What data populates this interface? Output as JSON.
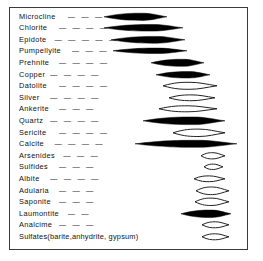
{
  "figure": {
    "type": "paragenetic-sequence-diagram",
    "border_color": "#3a3a3a",
    "background": "#ffffff",
    "fill_color": "#000000",
    "outline_color": "#222222",
    "leader_dash": "—",
    "rows": [
      {
        "label": "Microcline",
        "dashes": "—  —  —  —",
        "lens_start": 103,
        "lens_end": 166,
        "fill": "solid",
        "thickness": 7.2
      },
      {
        "label": "Chlorite",
        "dashes": "—  —  —  —  —",
        "lens_start": 103,
        "lens_end": 182,
        "fill": "solid",
        "thickness": 6.6
      },
      {
        "label": "Epidote",
        "dashes": "—  —  —  —  —",
        "lens_start": 110,
        "lens_end": 184,
        "fill": "solid",
        "thickness": 6.8
      },
      {
        "label": "Pumpellyite",
        "dashes": "—  —  —",
        "lens_start": 112,
        "lens_end": 186,
        "fill": "solid",
        "thickness": 5.4
      },
      {
        "label": "Prehnite",
        "dashes": "—  —  —  —",
        "lens_start": 150,
        "lens_end": 203,
        "fill": "solid",
        "thickness": 7.0
      },
      {
        "label": "Copper",
        "dashes": "—  —  —  —",
        "lens_start": 155,
        "lens_end": 209,
        "fill": "solid",
        "thickness": 6.4
      },
      {
        "label": "Datolite",
        "dashes": "—  —  —  —",
        "lens_start": 162,
        "lens_end": 216,
        "fill": "open",
        "thickness": 7.0
      },
      {
        "label": "Silver",
        "dashes": "—  —  —  —",
        "lens_start": 168,
        "lens_end": 214,
        "fill": "open",
        "thickness": 5.8
      },
      {
        "label": "Ankerite",
        "dashes": "—  —  —",
        "lens_start": 158,
        "lens_end": 216,
        "fill": "open",
        "thickness": 6.0
      },
      {
        "label": "Quartz",
        "dashes": "—  —  —  —",
        "lens_start": 142,
        "lens_end": 224,
        "fill": "solid",
        "thickness": 7.6
      },
      {
        "label": "Sericite",
        "dashes": "—  —  —  —",
        "lens_start": 172,
        "lens_end": 224,
        "fill": "open",
        "thickness": 7.4
      },
      {
        "label": "Calcite",
        "dashes": "—  —  —  —",
        "lens_start": 134,
        "lens_end": 236,
        "fill": "solid",
        "thickness": 7.0
      },
      {
        "label": "Arsenides",
        "dashes": "—  —  —",
        "lens_start": 200,
        "lens_end": 224,
        "fill": "open",
        "thickness": 6.2
      },
      {
        "label": "Sulfides",
        "dashes": "—  —  —",
        "lens_start": 203,
        "lens_end": 222,
        "fill": "open",
        "thickness": 5.4
      },
      {
        "label": "Albite",
        "dashes": "—  —  —  —",
        "lens_start": 193,
        "lens_end": 224,
        "fill": "open",
        "thickness": 5.8
      },
      {
        "label": "Adularia",
        "dashes": "—  —  —",
        "lens_start": 195,
        "lens_end": 228,
        "fill": "open",
        "thickness": 7.6
      },
      {
        "label": "Saponite",
        "dashes": "—  —  —",
        "lens_start": 194,
        "lens_end": 228,
        "fill": "open",
        "thickness": 7.4
      },
      {
        "label": "Laumontite",
        "dashes": "—  —",
        "lens_start": 180,
        "lens_end": 230,
        "fill": "solid",
        "thickness": 7.4
      },
      {
        "label": "Analcime",
        "dashes": "—  —  —",
        "lens_start": 201,
        "lens_end": 228,
        "fill": "open",
        "thickness": 6.0
      },
      {
        "label": "Sulfates(barite,anhydrite, gypsum)",
        "dashes": "",
        "lens_start": 201,
        "lens_end": 228,
        "fill": "open",
        "thickness": 6.0
      }
    ]
  }
}
